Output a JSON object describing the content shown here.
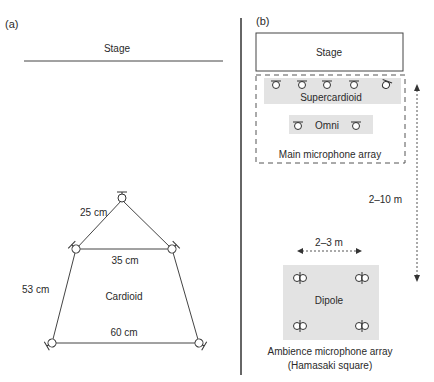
{
  "panel_a": {
    "label": "(a)",
    "stage_label": "Stage",
    "distances": {
      "top": "25 cm",
      "middle": "35 cm",
      "side": "53 cm",
      "bottom": "60 cm"
    },
    "pattern_label": "Cardioid"
  },
  "panel_b": {
    "label": "(b)",
    "stage_label": "Stage",
    "supercardioid_label": "Supercardioid",
    "omni_label": "Omni",
    "main_array_label": "Main microphone array",
    "vertical_distance": "2–10 m",
    "horizontal_distance": "2–3 m",
    "dipole_label": "Dipole",
    "ambience_label_line1": "Ambience microphone array",
    "ambience_label_line2": "(Hamasaki square)"
  },
  "colors": {
    "line": "#444444",
    "shade": "#e3e3e3",
    "text": "#2a2a2a"
  }
}
